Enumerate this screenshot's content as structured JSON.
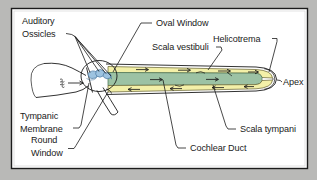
{
  "figure": {
    "panel": {
      "background_color": "#ffffff",
      "border_color": "#1b1b1b",
      "outer_background_color": "#b9b9b7"
    },
    "colors": {
      "scala_fluid": "#f3f0a8",
      "cochlear_duct": "#9cc2a4",
      "ossicles": "#9dc3e0",
      "ink": "#1b1b1b"
    },
    "labels": [
      {
        "id": "auditory-ossicles",
        "line1": "Auditory",
        "line2": "Ossicles"
      },
      {
        "id": "oval-window",
        "line1": "Oval Window"
      },
      {
        "id": "helicotrema",
        "line1": "Helicotrema"
      },
      {
        "id": "scala-vestibuli",
        "line1": "Scala vestibuli"
      },
      {
        "id": "apex",
        "line1": "Apex"
      },
      {
        "id": "tympanic-membrane",
        "line1": "Tympanic",
        "line2": "Membrane"
      },
      {
        "id": "round-window",
        "line1": "Round",
        "line2": "Window"
      },
      {
        "id": "cochlear-duct",
        "line1": "Cochlear Duct"
      },
      {
        "id": "scala-tympani",
        "line1": "Scala tympani"
      }
    ],
    "flow": {
      "scala_vestibuli_direction": "right",
      "scala_tympani_direction": "left",
      "sound_input": "sound-wave-arrow"
    }
  }
}
